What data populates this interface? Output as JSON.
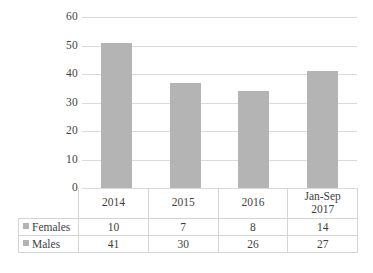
{
  "chart_data": {
    "type": "bar",
    "title": "",
    "subtitle": "",
    "xlabel": "",
    "ylabel": "",
    "categories": [
      "2014",
      "2015",
      "2016",
      "Jan-Sep 2017"
    ],
    "category_lines": [
      [
        "2014"
      ],
      [
        "2015"
      ],
      [
        "2016"
      ],
      [
        "Jan-Sep",
        "2017"
      ]
    ],
    "values": [
      51,
      37,
      34,
      41
    ],
    "series": [
      {
        "name": "Females",
        "values": [
          10,
          7,
          8,
          14
        ]
      },
      {
        "name": "Males",
        "values": [
          41,
          30,
          26,
          27
        ]
      }
    ],
    "plotted_series": {
      "name": "Total",
      "values": [
        51,
        37,
        34,
        41
      ]
    },
    "ylim": [
      0,
      60
    ],
    "ytick_values": [
      60,
      50,
      40,
      30,
      20,
      10,
      0
    ],
    "ytick_labels": [
      "60",
      "50",
      "40",
      "30",
      "20",
      "10",
      "0"
    ],
    "grid": true,
    "grid_axis": "y",
    "legend": true,
    "legend_position": "data-table-left",
    "bar_color": "#b4b4b4",
    "gridline_color": "#d9d9d9",
    "text_color": "#3f3f3f",
    "table_border_color": "#d4d4d4"
  },
  "data_table": {
    "row_labels": [
      "Females",
      "Males"
    ],
    "columns": [
      "2014",
      "2015",
      "2016",
      "Jan-Sep 2017"
    ],
    "rows": [
      {
        "label": "Females",
        "cells": [
          "10",
          "7",
          "8",
          "14"
        ]
      },
      {
        "label": "Males",
        "cells": [
          "41",
          "30",
          "26",
          "27"
        ]
      }
    ]
  }
}
